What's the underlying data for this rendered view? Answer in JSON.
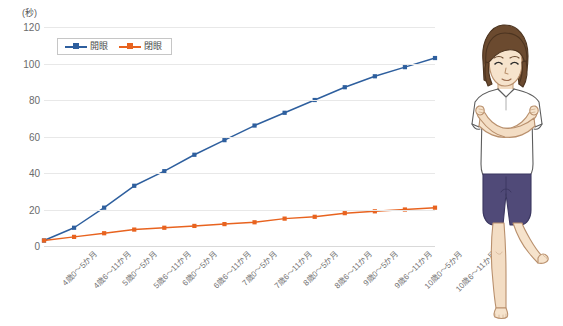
{
  "chart_data": {
    "type": "line",
    "title": "",
    "subtitle": "",
    "unit_label": "(秒)",
    "xlabel": "",
    "ylabel": "",
    "ylim": [
      0,
      120
    ],
    "yticks": [
      0,
      20,
      40,
      60,
      80,
      100,
      120
    ],
    "grid": true,
    "legend_position": "top-left",
    "categories": [
      "4歳0～5か月",
      "4歳6～11か月",
      "5歳0～5か月",
      "5歳6～11か月",
      "6歳0～5か月",
      "6歳6～11か月",
      "7歳0～5か月",
      "7歳6～11か月",
      "8歳0～5か月",
      "8歳6～11か月",
      "9歳0～5か月",
      "9歳6～11か月",
      "10歳0～5か月",
      "10歳6～11か月"
    ],
    "series": [
      {
        "name": "開眼",
        "color": "#2e5f9e",
        "values": [
          3,
          10,
          21,
          33,
          41,
          50,
          58,
          66,
          73,
          80,
          87,
          93,
          98,
          103
        ]
      },
      {
        "name": "閉眼",
        "color": "#e8631f",
        "values": [
          3,
          5,
          7,
          9,
          10,
          11,
          12,
          13,
          15,
          16,
          18,
          19,
          20,
          21
        ]
      }
    ]
  },
  "legend": {
    "items": [
      {
        "label": "開眼",
        "color": "#2e5f9e"
      },
      {
        "label": "閉眼",
        "color": "#e8631f"
      }
    ]
  },
  "illustration": {
    "name": "child-one-leg-balance",
    "description": "子どもが腕を交差して片足立ちをしている図",
    "colors": {
      "hair": "#6b4a2f",
      "skin": "#f3ddc4",
      "shirt": "#ffffff",
      "shorts": "#504a78",
      "outline": "#3a3a3a"
    }
  }
}
